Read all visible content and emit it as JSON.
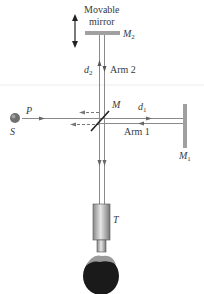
{
  "labels": {
    "movable": "Movable",
    "mirror": "mirror",
    "M2": "M",
    "M2_sub": "2",
    "d2": "d",
    "d2_sub": "2",
    "arm2": "Arm 2",
    "M": "M",
    "d1": "d",
    "d1_sub": "1",
    "arm1": "Arm 1",
    "M1": "M",
    "M1_sub": "1",
    "P": "P",
    "S": "S",
    "T": "T"
  },
  "colors": {
    "beam": "#8a8a8a",
    "mirror": "#9a9a9a",
    "text": "#3a3a3a",
    "source": "#707070",
    "head": "#1a1a1a"
  }
}
